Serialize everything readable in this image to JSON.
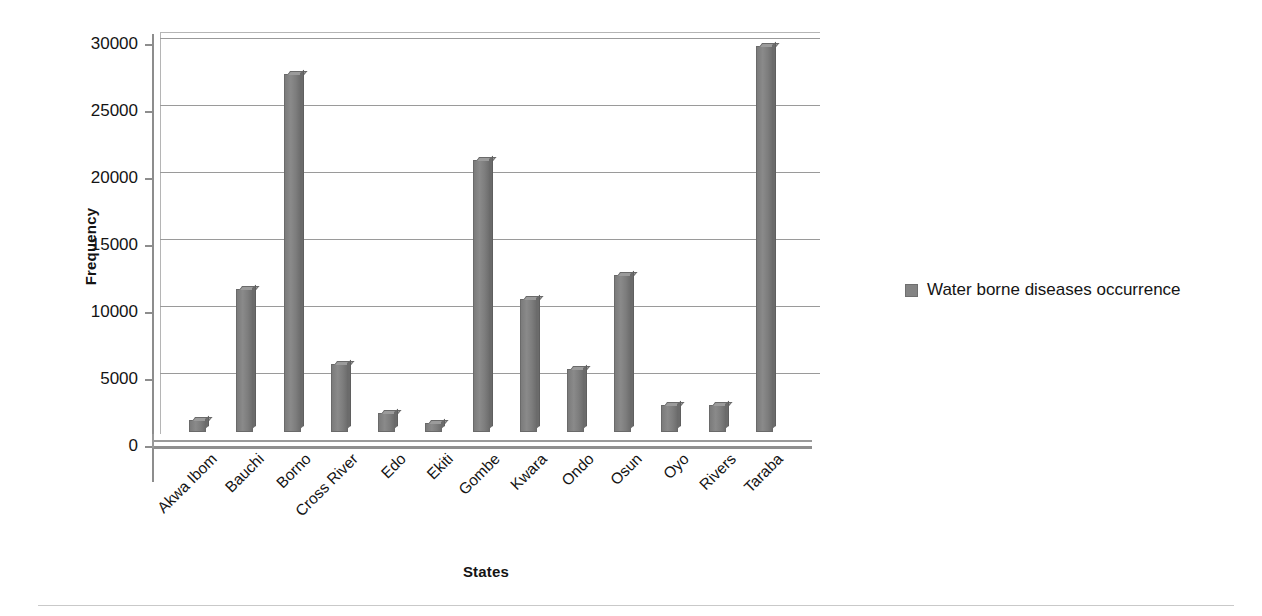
{
  "chart_data": {
    "type": "bar",
    "title": "",
    "xlabel": "States",
    "ylabel": "Frequency",
    "categories": [
      "Akwa Ibom",
      "Bauchi",
      "Borno",
      "Cross River",
      "Edo",
      "Ekiti",
      "Gombe",
      "Kwara",
      "Ondo",
      "Osun",
      "Oyo",
      "Rivers",
      "Taraba"
    ],
    "values": [
      900,
      10700,
      26700,
      5100,
      1400,
      700,
      20300,
      9900,
      4700,
      11700,
      2050,
      2050,
      28800
    ],
    "series": [
      {
        "name": "Water borne diseases occurrence",
        "values": [
          900,
          10700,
          26700,
          5100,
          1400,
          700,
          20300,
          9900,
          4700,
          11700,
          2050,
          2050,
          28800
        ]
      }
    ],
    "ylim": [
      0,
      30000
    ],
    "yticks": [
      0,
      5000,
      10000,
      15000,
      20000,
      25000,
      30000
    ],
    "ytick_labels": [
      "0",
      "5000",
      "10000",
      "15000",
      "20000",
      "25000",
      "30000"
    ],
    "grid": "horizontal",
    "legend_position": "right",
    "bar_color": "#848484",
    "gridline_color": "#9a9a9a",
    "axis_color": "#8d8d8d",
    "background": "#ffffff"
  },
  "legend": {
    "entries": [
      {
        "label": "Water borne diseases occurrence",
        "color": "#848484",
        "marker": "square-swatch-icon"
      }
    ]
  },
  "axes": {
    "y_title": "Frequency",
    "x_title": "States"
  }
}
